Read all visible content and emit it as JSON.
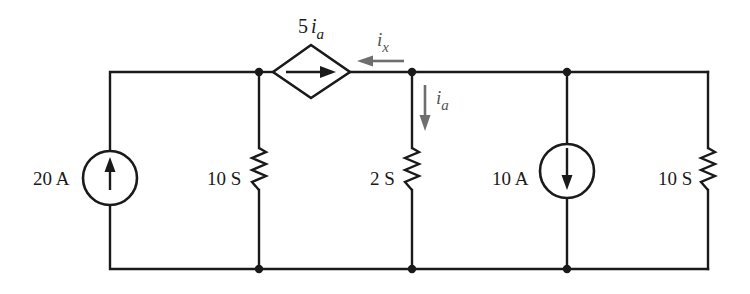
{
  "diagram": {
    "type": "electrical-circuit",
    "colors": {
      "wire": "#1a1a1a",
      "reference_arrow": "#6e6e6e",
      "background": "#ffffff"
    },
    "components": {
      "source_20A": {
        "label": "20 A",
        "kind": "independent-current-source",
        "direction": "up"
      },
      "resistor_10S_left": {
        "label": "10 S",
        "kind": "conductance"
      },
      "dependent_source": {
        "coef": "5",
        "var": "i",
        "sub": "a",
        "kind": "dependent-current-source",
        "direction": "right"
      },
      "resistor_2S": {
        "label": "2 S",
        "kind": "conductance"
      },
      "source_10A": {
        "label": "10 A",
        "kind": "independent-current-source",
        "direction": "down"
      },
      "resistor_10S_right": {
        "label": "10 S",
        "kind": "conductance"
      }
    },
    "currents": {
      "ix": {
        "var": "i",
        "sub": "x",
        "direction": "left"
      },
      "ia": {
        "var": "i",
        "sub": "a",
        "direction": "down"
      }
    }
  }
}
